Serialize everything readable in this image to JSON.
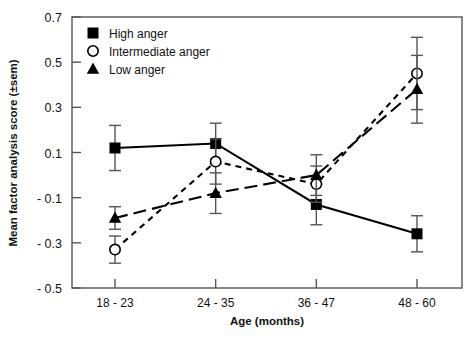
{
  "chart_data": {
    "type": "line",
    "title": "",
    "xlabel": "Age (months)",
    "ylabel": "Mean factor analysis score (±sem)",
    "categories": [
      "18 - 23",
      "24 - 35",
      "36 - 47",
      "48 - 60"
    ],
    "ylim": [
      -0.5,
      0.7
    ],
    "yticks": [
      0.7,
      0.5,
      0.3,
      0.1,
      -0.1,
      -0.3,
      -0.5
    ],
    "ytick_labels": [
      "0.7",
      "0.5",
      "0.3",
      "0.1",
      "- 0.1",
      "- 0.3",
      "- 0.5"
    ],
    "grid": false,
    "legend_position": "top-left",
    "errorbars": "sem",
    "series": [
      {
        "name": "High anger",
        "marker": "filled-square",
        "linestyle": "solid",
        "color": "#000000",
        "values": [
          0.12,
          0.14,
          -0.13,
          -0.26
        ],
        "errors": [
          0.1,
          0.09,
          0.09,
          0.08
        ]
      },
      {
        "name": "Intermediate anger",
        "marker": "open-circle",
        "linestyle": "short-dash",
        "color": "#000000",
        "values": [
          -0.33,
          0.06,
          -0.04,
          0.45
        ],
        "errors": [
          0.06,
          0.1,
          0.08,
          0.16
        ]
      },
      {
        "name": "Low anger",
        "marker": "filled-triangle",
        "linestyle": "long-dash",
        "color": "#000000",
        "values": [
          -0.19,
          -0.08,
          0.0,
          0.38
        ],
        "errors": [
          0.05,
          0.09,
          0.09,
          0.15
        ]
      }
    ]
  },
  "legend": {
    "items": [
      {
        "label": "High anger",
        "marker": "filled-square"
      },
      {
        "label": "Intermediate anger",
        "marker": "open-circle"
      },
      {
        "label": "Low anger",
        "marker": "filled-triangle"
      }
    ]
  },
  "axes": {
    "y_title": "Mean factor analysis score (±sem)",
    "x_title": "Age (months)"
  }
}
